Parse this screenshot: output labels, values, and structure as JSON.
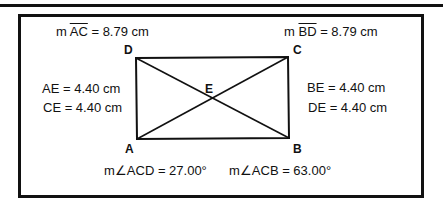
{
  "measurements": {
    "ac_prefix": "m",
    "ac_segment": "AC",
    "ac_value": "= 8.79 cm",
    "bd_prefix": "m",
    "bd_segment": "BD",
    "bd_value": "= 8.79 cm",
    "ae": "AE = 4.40 cm",
    "ce": "CE = 4.40 cm",
    "be": "BE = 4.40 cm",
    "de": "DE = 4.40 cm",
    "angle_acd": "m∠ACD = 27.00°",
    "angle_acb": "m∠ACB = 63.00°"
  },
  "vertices": {
    "a": "A",
    "b": "B",
    "c": "C",
    "d": "D",
    "e": "E"
  }
}
